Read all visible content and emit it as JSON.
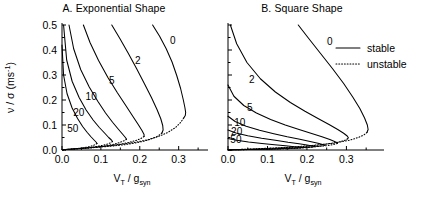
{
  "figure": {
    "legend": {
      "stable_label": "stable",
      "unstable_label": "unstable"
    }
  },
  "panels": [
    {
      "id": "A",
      "title": "A. Exponential Shape",
      "xlabel_main": "V",
      "xlabel_sub": "T",
      "xlabel_mid": " / g",
      "xlabel_sub2": "syn",
      "ylabel_main": "ν / σ (ms",
      "ylabel_sup": "-1",
      "ylabel_end": ")",
      "xticks": [
        "0.0",
        "0.1",
        "0.2",
        "0.3"
      ],
      "yticks": [
        "0.0",
        "0.1",
        "0.2",
        "0.3",
        "0.4",
        "0.5"
      ],
      "curve_labels": [
        "0",
        "2",
        "5",
        "10",
        "20",
        "50"
      ]
    },
    {
      "id": "B",
      "title": "B. Square Shape",
      "xlabel_main": "V",
      "xlabel_sub": "T",
      "xlabel_mid": " / g",
      "xlabel_sub2": "syn",
      "xticks": [
        "0.0",
        "0.1",
        "0.2",
        "0.3"
      ],
      "yticks": [
        "",
        "",
        "",
        "",
        "",
        ""
      ],
      "curve_labels": [
        "0",
        "2",
        "5",
        "10",
        "20",
        "50"
      ]
    }
  ],
  "chart_data": {
    "type": "line",
    "xlabel": "V_T / g_syn",
    "ylabel": "nu / sigma (ms^-1)",
    "xlim": [
      0.0,
      0.36
    ],
    "ylim": [
      0.0,
      0.5
    ],
    "grid": false,
    "legend_position": "upper-right-of-panel-B",
    "legend_entries": [
      {
        "name": "stable",
        "style": "solid"
      },
      {
        "name": "unstable",
        "style": "dotted"
      }
    ],
    "panels": [
      {
        "panel": "A",
        "title": "A. Exponential Shape",
        "xticks": [
          0.0,
          0.1,
          0.2,
          0.3
        ],
        "yticks": [
          0.0,
          0.1,
          0.2,
          0.3,
          0.4,
          0.5
        ],
        "series": [
          {
            "name": "0",
            "label_value": 0,
            "stable_branch": {
              "x": [
                0.233,
                0.251,
                0.268,
                0.283,
                0.295,
                0.305,
                0.312,
                0.316,
                0.318,
                0.317,
                0.313
              ],
              "y": [
                0.5,
                0.455,
                0.405,
                0.352,
                0.298,
                0.246,
                0.2,
                0.17,
                0.15,
                0.138,
                0.128
              ]
            },
            "unstable_branch": {
              "x": [
                0.313,
                0.305,
                0.292,
                0.272,
                0.248,
                0.218,
                0.185,
                0.15,
                0.115,
                0.08,
                0.045,
                0.015,
                0.0
              ],
              "y": [
                0.128,
                0.11,
                0.09,
                0.07,
                0.054,
                0.04,
                0.03,
                0.022,
                0.016,
                0.011,
                0.007,
                0.003,
                0.001
              ]
            }
          },
          {
            "name": "2",
            "label_value": 2,
            "stable_branch": {
              "x": [
                0.128,
                0.148,
                0.17,
                0.192,
                0.212,
                0.23,
                0.244,
                0.254,
                0.259,
                0.26,
                0.257
              ],
              "y": [
                0.5,
                0.448,
                0.388,
                0.325,
                0.265,
                0.21,
                0.163,
                0.125,
                0.098,
                0.08,
                0.068
              ]
            },
            "unstable_branch": {
              "x": [
                0.257,
                0.248,
                0.233,
                0.213,
                0.188,
                0.16,
                0.13,
                0.1,
                0.07,
                0.042,
                0.018,
                0.0
              ],
              "y": [
                0.068,
                0.057,
                0.046,
                0.036,
                0.028,
                0.021,
                0.016,
                0.012,
                0.008,
                0.005,
                0.002,
                0.001
              ]
            }
          },
          {
            "name": "5",
            "label_value": 5,
            "stable_branch": {
              "x": [
                0.055,
                0.072,
                0.094,
                0.118,
                0.142,
                0.164,
                0.182,
                0.196,
                0.206,
                0.211,
                0.211
              ],
              "y": [
                0.5,
                0.43,
                0.358,
                0.29,
                0.23,
                0.178,
                0.135,
                0.102,
                0.077,
                0.062,
                0.054
              ]
            },
            "unstable_branch": {
              "x": [
                0.211,
                0.203,
                0.19,
                0.172,
                0.15,
                0.126,
                0.1,
                0.074,
                0.05,
                0.028,
                0.01,
                0.0
              ],
              "y": [
                0.054,
                0.046,
                0.038,
                0.03,
                0.023,
                0.018,
                0.013,
                0.009,
                0.006,
                0.004,
                0.002,
                0.001
              ]
            }
          },
          {
            "name": "10",
            "label_value": 10,
            "stable_branch": {
              "x": [
                0.018,
                0.03,
                0.048,
                0.07,
                0.092,
                0.112,
                0.13,
                0.145,
                0.156,
                0.163,
                0.166
              ],
              "y": [
                0.5,
                0.405,
                0.322,
                0.252,
                0.195,
                0.148,
                0.111,
                0.083,
                0.063,
                0.05,
                0.043
              ]
            },
            "unstable_branch": {
              "x": [
                0.166,
                0.16,
                0.15,
                0.136,
                0.119,
                0.1,
                0.079,
                0.058,
                0.038,
                0.02,
                0.006,
                0.0
              ],
              "y": [
                0.043,
                0.037,
                0.031,
                0.024,
                0.019,
                0.014,
                0.01,
                0.007,
                0.005,
                0.003,
                0.001,
                0.0
              ]
            }
          },
          {
            "name": "20",
            "label_value": 20,
            "stable_branch": {
              "x": [
                0.004,
                0.012,
                0.026,
                0.044,
                0.062,
                0.08,
                0.096,
                0.11,
                0.12,
                0.127,
                0.13
              ],
              "y": [
                0.5,
                0.36,
                0.275,
                0.21,
                0.16,
                0.12,
                0.09,
                0.067,
                0.05,
                0.04,
                0.034
              ]
            },
            "unstable_branch": {
              "x": [
                0.13,
                0.125,
                0.117,
                0.106,
                0.092,
                0.077,
                0.06,
                0.044,
                0.028,
                0.014,
                0.004,
                0.0
              ],
              "y": [
                0.034,
                0.029,
                0.024,
                0.019,
                0.015,
                0.011,
                0.008,
                0.006,
                0.004,
                0.002,
                0.001,
                0.0
              ]
            }
          },
          {
            "name": "50",
            "label_value": 50,
            "stable_branch": {
              "x": [
                0.0,
                0.004,
                0.013,
                0.026,
                0.04,
                0.053,
                0.065,
                0.075,
                0.083,
                0.088,
                0.09
              ],
              "y": [
                0.42,
                0.3,
                0.225,
                0.168,
                0.126,
                0.094,
                0.07,
                0.052,
                0.039,
                0.031,
                0.026
              ]
            },
            "unstable_branch": {
              "x": [
                0.09,
                0.086,
                0.08,
                0.072,
                0.062,
                0.051,
                0.04,
                0.029,
                0.018,
                0.009,
                0.002,
                0.0
              ],
              "y": [
                0.026,
                0.022,
                0.018,
                0.014,
                0.011,
                0.008,
                0.006,
                0.004,
                0.003,
                0.002,
                0.001,
                0.0
              ]
            }
          }
        ]
      },
      {
        "panel": "B",
        "title": "B. Square Shape",
        "xticks": [
          0.0,
          0.1,
          0.2,
          0.3
        ],
        "yticks": [
          0.0,
          0.1,
          0.2,
          0.3,
          0.4,
          0.5
        ],
        "series": [
          {
            "name": "0",
            "label_value": 0,
            "stable_branch": {
              "x": [
                0.178,
                0.205,
                0.235,
                0.265,
                0.293,
                0.316,
                0.334,
                0.346,
                0.353,
                0.355,
                0.352
              ],
              "y": [
                0.5,
                0.445,
                0.385,
                0.325,
                0.266,
                0.212,
                0.166,
                0.128,
                0.1,
                0.082,
                0.07
              ]
            },
            "unstable_branch": {
              "x": [
                0.352,
                0.344,
                0.33,
                0.31,
                0.284,
                0.253,
                0.218,
                0.18,
                0.14,
                0.1,
                0.06,
                0.025,
                0.0
              ],
              "y": [
                0.07,
                0.06,
                0.05,
                0.04,
                0.032,
                0.025,
                0.019,
                0.014,
                0.01,
                0.007,
                0.004,
                0.002,
                0.001
              ]
            }
          },
          {
            "name": "2",
            "label_value": 2,
            "stable_branch": {
              "x": [
                0.006,
                0.022,
                0.048,
                0.082,
                0.12,
                0.158,
                0.195,
                0.228,
                0.256,
                0.278,
                0.293,
                0.302,
                0.305,
                0.303
              ],
              "y": [
                0.5,
                0.425,
                0.35,
                0.285,
                0.232,
                0.19,
                0.155,
                0.126,
                0.102,
                0.082,
                0.067,
                0.056,
                0.049,
                0.045
              ]
            },
            "unstable_branch": {
              "x": [
                0.303,
                0.296,
                0.284,
                0.266,
                0.243,
                0.215,
                0.184,
                0.15,
                0.115,
                0.08,
                0.048,
                0.02,
                0.0
              ],
              "y": [
                0.045,
                0.039,
                0.033,
                0.027,
                0.022,
                0.017,
                0.013,
                0.01,
                0.007,
                0.005,
                0.003,
                0.002,
                0.001
              ]
            }
          },
          {
            "name": "5",
            "label_value": 5,
            "stable_branch": {
              "x": [
                0.0,
                0.015,
                0.04,
                0.072,
                0.108,
                0.145,
                0.18,
                0.212,
                0.238,
                0.258,
                0.27,
                0.276,
                0.277
              ],
              "y": [
                0.26,
                0.215,
                0.178,
                0.148,
                0.122,
                0.1,
                0.082,
                0.066,
                0.053,
                0.042,
                0.034,
                0.029,
                0.026
              ]
            },
            "unstable_branch": {
              "x": [
                0.277,
                0.27,
                0.258,
                0.242,
                0.22,
                0.194,
                0.165,
                0.134,
                0.102,
                0.07,
                0.04,
                0.016,
                0.0
              ],
              "y": [
                0.026,
                0.023,
                0.019,
                0.016,
                0.013,
                0.01,
                0.008,
                0.006,
                0.004,
                0.003,
                0.002,
                0.001,
                0.0
              ]
            }
          },
          {
            "name": "10",
            "label_value": 10,
            "stable_branch": {
              "x": [
                0.0,
                0.018,
                0.046,
                0.08,
                0.116,
                0.15,
                0.182,
                0.208,
                0.228,
                0.24,
                0.245
              ],
              "y": [
                0.135,
                0.114,
                0.095,
                0.079,
                0.065,
                0.053,
                0.043,
                0.034,
                0.027,
                0.022,
                0.019
              ]
            },
            "unstable_branch": {
              "x": [
                0.245,
                0.238,
                0.227,
                0.211,
                0.19,
                0.165,
                0.138,
                0.11,
                0.08,
                0.052,
                0.026,
                0.008,
                0.0
              ],
              "y": [
                0.019,
                0.017,
                0.014,
                0.012,
                0.01,
                0.008,
                0.006,
                0.004,
                0.003,
                0.002,
                0.001,
                0.001,
                0.0
              ]
            }
          },
          {
            "name": "20",
            "label_value": 20,
            "stable_branch": {
              "x": [
                0.0,
                0.02,
                0.05,
                0.085,
                0.12,
                0.152,
                0.18,
                0.2,
                0.214,
                0.22
              ],
              "y": [
                0.08,
                0.068,
                0.057,
                0.047,
                0.039,
                0.031,
                0.025,
                0.02,
                0.016,
                0.014
              ]
            },
            "unstable_branch": {
              "x": [
                0.22,
                0.214,
                0.204,
                0.19,
                0.17,
                0.147,
                0.122,
                0.095,
                0.068,
                0.042,
                0.02,
                0.005,
                0.0
              ],
              "y": [
                0.014,
                0.012,
                0.01,
                0.009,
                0.007,
                0.006,
                0.004,
                0.003,
                0.002,
                0.002,
                0.001,
                0.0,
                0.0
              ]
            }
          },
          {
            "name": "50",
            "label_value": 50,
            "stable_branch": {
              "x": [
                0.0,
                0.022,
                0.052,
                0.086,
                0.118,
                0.146,
                0.168,
                0.183,
                0.19
              ],
              "y": [
                0.046,
                0.039,
                0.032,
                0.026,
                0.021,
                0.017,
                0.013,
                0.011,
                0.009
              ]
            },
            "unstable_branch": {
              "x": [
                0.19,
                0.184,
                0.175,
                0.162,
                0.145,
                0.125,
                0.103,
                0.08,
                0.056,
                0.034,
                0.015,
                0.003,
                0.0
              ],
              "y": [
                0.009,
                0.008,
                0.007,
                0.006,
                0.005,
                0.004,
                0.003,
                0.002,
                0.002,
                0.001,
                0.001,
                0.0,
                0.0
              ]
            }
          }
        ]
      }
    ]
  }
}
